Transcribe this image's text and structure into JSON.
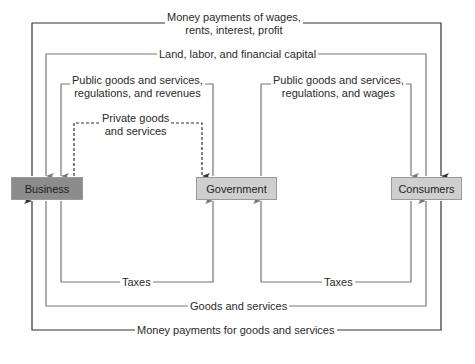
{
  "nodes": {
    "business": {
      "label": "Business",
      "color": "#8c8c8c"
    },
    "government": {
      "label": "Government",
      "color": "#cfcfcf"
    },
    "consumers": {
      "label": "Consumers",
      "color": "#cfcfcf"
    }
  },
  "flows": {
    "money_wages": {
      "line1": "Money payments of wages,",
      "line2": "rents, interest, profit"
    },
    "factors": {
      "label": "Land, labor, and financial capital"
    },
    "gov_to_business": {
      "line1": "Public goods and services,",
      "line2": "regulations, and revenues"
    },
    "gov_to_consumers": {
      "line1": "Public goods and services,",
      "line2": "regulations, and wages"
    },
    "private_goods": {
      "line1": "Private goods",
      "line2": "and services"
    },
    "business_taxes": {
      "label": "Taxes"
    },
    "consumer_taxes": {
      "label": "Taxes"
    },
    "goods_services": {
      "label": "Goods and services"
    },
    "money_goods": {
      "label": "Money payments for goods and services"
    }
  },
  "colors": {
    "dark_line": "#333333",
    "gray_line": "#777777"
  }
}
